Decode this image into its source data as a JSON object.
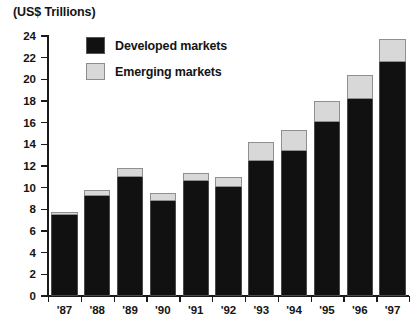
{
  "chart_data": {
    "type": "bar",
    "subtype": "stacked-vertical",
    "title": "(US$ Trillions)",
    "xlabel": "",
    "ylabel": "",
    "ylim": [
      0,
      24
    ],
    "ytick_step": 2,
    "ytick_labels": [
      "24",
      "22",
      "20",
      "18",
      "16",
      "14",
      "12",
      "10",
      "8",
      "6",
      "4",
      "2",
      "0"
    ],
    "ytick_values": [
      24,
      22,
      20,
      18,
      16,
      14,
      12,
      10,
      8,
      6,
      4,
      2,
      0
    ],
    "grid": false,
    "legend_position": "inside-top-left",
    "categories": [
      "'87",
      "'88",
      "'89",
      "'90",
      "'91",
      "'92",
      "'93",
      "'94",
      "'95",
      "'96",
      "'97"
    ],
    "series": [
      {
        "name": "Developed markets",
        "color": "#111111",
        "values": [
          7.5,
          9.2,
          11.0,
          8.8,
          10.6,
          10.1,
          12.5,
          13.4,
          16.1,
          18.2,
          21.6
        ]
      },
      {
        "name": "Emerging markets",
        "color": "#d8d8d8",
        "values": [
          0.3,
          0.6,
          0.8,
          0.7,
          0.8,
          0.9,
          1.7,
          1.9,
          1.9,
          2.2,
          2.1
        ]
      }
    ],
    "totals": [
      7.8,
      9.8,
      11.8,
      9.5,
      11.4,
      11.0,
      14.2,
      15.3,
      18.0,
      20.4,
      23.7
    ]
  }
}
